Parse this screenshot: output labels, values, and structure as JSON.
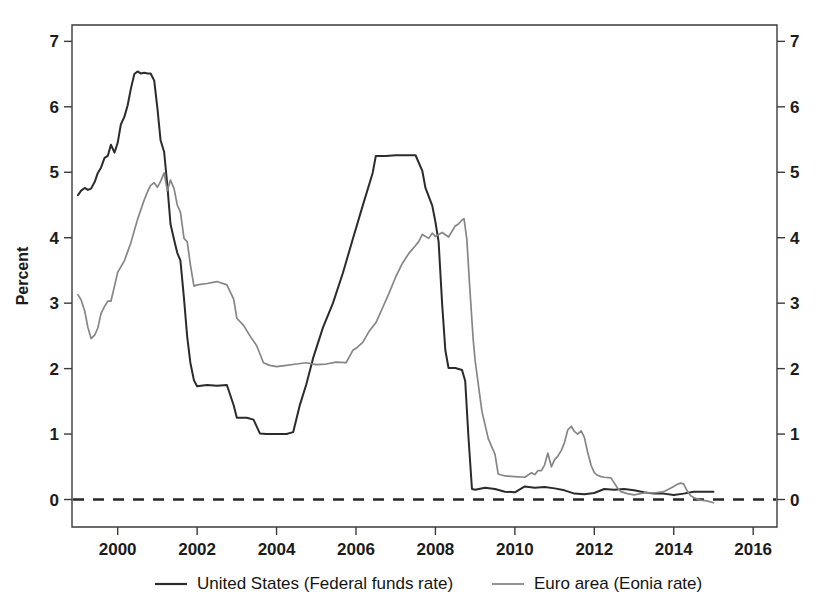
{
  "chart_data": {
    "type": "line",
    "title": "",
    "subtitle": "",
    "xlabel": "",
    "ylabel": "Percent",
    "xlim": [
      1998.85,
      2016.6
    ],
    "ylim": [
      -0.42,
      7.25
    ],
    "grid": false,
    "legend_position": "bottom",
    "x_ticks": [
      2000,
      2002,
      2004,
      2006,
      2008,
      2010,
      2012,
      2014,
      2016
    ],
    "x_tick_labels": [
      "2000",
      "2002",
      "2004",
      "2006",
      "2008",
      "2010",
      "2012",
      "2014",
      "2016"
    ],
    "y_ticks": [
      0,
      1,
      2,
      3,
      4,
      5,
      6,
      7
    ],
    "y_tick_labels": [
      "0",
      "1",
      "2",
      "3",
      "4",
      "5",
      "6",
      "7"
    ],
    "y_ticks_right": [
      0,
      1,
      2,
      3,
      4,
      5,
      6,
      7
    ],
    "y_tick_labels_right": [
      "0",
      "1",
      "2",
      "3",
      "4",
      "5",
      "6",
      "7"
    ],
    "reference_lines": [
      {
        "name": "zero-reference-line",
        "axis": "y",
        "value": 0,
        "style": "dashed"
      }
    ],
    "series": [
      {
        "name": "United States (Federal funds rate)",
        "short_name": "united-states",
        "color": "#2b2b2b",
        "width": 2.0,
        "x": [
          1999.0,
          1999.08,
          1999.17,
          1999.25,
          1999.33,
          1999.42,
          1999.5,
          1999.58,
          1999.67,
          1999.75,
          1999.83,
          1999.92,
          2000.0,
          2000.08,
          2000.17,
          2000.25,
          2000.33,
          2000.42,
          2000.5,
          2000.58,
          2000.67,
          2000.75,
          2000.83,
          2000.92,
          2001.0,
          2001.08,
          2001.17,
          2001.25,
          2001.33,
          2001.42,
          2001.5,
          2001.58,
          2001.67,
          2001.75,
          2001.83,
          2001.92,
          2002.0,
          2002.25,
          2002.5,
          2002.75,
          2002.92,
          2003.0,
          2003.25,
          2003.42,
          2003.58,
          2003.75,
          2004.0,
          2004.25,
          2004.42,
          2004.58,
          2004.75,
          2004.92,
          2005.17,
          2005.42,
          2005.67,
          2005.92,
          2006.17,
          2006.42,
          2006.5,
          2006.75,
          2007.0,
          2007.25,
          2007.5,
          2007.67,
          2007.75,
          2007.92,
          2008.0,
          2008.08,
          2008.17,
          2008.25,
          2008.33,
          2008.5,
          2008.67,
          2008.75,
          2008.83,
          2008.92,
          2009.0,
          2009.25,
          2009.5,
          2009.75,
          2010.0,
          2010.25,
          2010.5,
          2010.75,
          2011.0,
          2011.25,
          2011.5,
          2011.75,
          2012.0,
          2012.25,
          2012.5,
          2012.75,
          2013.0,
          2013.25,
          2013.5,
          2013.75,
          2014.0,
          2014.25,
          2014.5,
          2014.75,
          2015.0
        ],
        "y": [
          4.65,
          4.72,
          4.76,
          4.73,
          4.75,
          4.85,
          4.99,
          5.07,
          5.22,
          5.25,
          5.42,
          5.3,
          5.45,
          5.73,
          5.85,
          6.02,
          6.27,
          6.5,
          6.54,
          6.51,
          6.52,
          6.51,
          6.51,
          6.4,
          5.98,
          5.49,
          5.31,
          4.8,
          4.21,
          3.97,
          3.77,
          3.65,
          3.07,
          2.49,
          2.09,
          1.82,
          1.73,
          1.75,
          1.74,
          1.75,
          1.44,
          1.25,
          1.25,
          1.22,
          1.01,
          1.0,
          1.0,
          1.0,
          1.03,
          1.43,
          1.76,
          2.16,
          2.63,
          3.0,
          3.46,
          3.98,
          4.49,
          4.99,
          5.25,
          5.25,
          5.26,
          5.26,
          5.26,
          5.02,
          4.76,
          4.49,
          4.24,
          3.94,
          2.98,
          2.28,
          2.01,
          2.01,
          1.98,
          1.81,
          0.97,
          0.16,
          0.15,
          0.18,
          0.16,
          0.12,
          0.11,
          0.2,
          0.18,
          0.19,
          0.17,
          0.14,
          0.09,
          0.08,
          0.1,
          0.16,
          0.15,
          0.16,
          0.14,
          0.11,
          0.09,
          0.09,
          0.07,
          0.09,
          0.12,
          0.12,
          0.12
        ]
      },
      {
        "name": "Euro area (Eonia rate)",
        "short_name": "euro-area",
        "color": "#868686",
        "width": 1.7,
        "x": [
          1999.0,
          1999.08,
          1999.17,
          1999.25,
          1999.33,
          1999.42,
          1999.5,
          1999.58,
          1999.67,
          1999.75,
          1999.83,
          1999.92,
          2000.0,
          2000.17,
          2000.33,
          2000.5,
          2000.67,
          2000.75,
          2000.83,
          2000.92,
          2001.0,
          2001.08,
          2001.17,
          2001.25,
          2001.33,
          2001.42,
          2001.5,
          2001.58,
          2001.67,
          2001.75,
          2001.83,
          2001.92,
          2002.0,
          2002.25,
          2002.5,
          2002.75,
          2002.92,
          2003.0,
          2003.17,
          2003.33,
          2003.5,
          2003.67,
          2003.83,
          2004.0,
          2004.25,
          2004.5,
          2004.75,
          2005.0,
          2005.25,
          2005.5,
          2005.75,
          2005.92,
          2006.0,
          2006.17,
          2006.33,
          2006.5,
          2006.67,
          2006.83,
          2007.0,
          2007.17,
          2007.33,
          2007.5,
          2007.58,
          2007.67,
          2007.83,
          2007.92,
          2008.0,
          2008.17,
          2008.33,
          2008.5,
          2008.58,
          2008.67,
          2008.72,
          2008.79,
          2008.87,
          2008.95,
          2009.0,
          2009.17,
          2009.33,
          2009.5,
          2009.58,
          2009.75,
          2010.0,
          2010.25,
          2010.42,
          2010.5,
          2010.58,
          2010.67,
          2010.75,
          2010.83,
          2010.92,
          2011.0,
          2011.08,
          2011.17,
          2011.25,
          2011.33,
          2011.42,
          2011.5,
          2011.58,
          2011.67,
          2011.75,
          2011.83,
          2011.92,
          2012.0,
          2012.08,
          2012.17,
          2012.25,
          2012.42,
          2012.58,
          2012.67,
          2012.83,
          2013.0,
          2013.25,
          2013.5,
          2013.75,
          2014.0,
          2014.08,
          2014.17,
          2014.25,
          2014.33,
          2014.42,
          2014.5,
          2014.58,
          2014.67,
          2014.83,
          2015.0
        ],
        "y": [
          3.13,
          3.05,
          2.88,
          2.63,
          2.46,
          2.51,
          2.62,
          2.84,
          2.95,
          3.03,
          3.03,
          3.26,
          3.47,
          3.65,
          3.92,
          4.28,
          4.58,
          4.7,
          4.8,
          4.84,
          4.77,
          4.86,
          4.99,
          4.72,
          4.88,
          4.75,
          4.5,
          4.39,
          3.99,
          3.94,
          3.59,
          3.26,
          3.28,
          3.3,
          3.33,
          3.28,
          3.06,
          2.77,
          2.66,
          2.5,
          2.35,
          2.09,
          2.05,
          2.03,
          2.05,
          2.07,
          2.09,
          2.06,
          2.07,
          2.1,
          2.09,
          2.28,
          2.31,
          2.4,
          2.57,
          2.7,
          2.93,
          3.15,
          3.4,
          3.61,
          3.76,
          3.88,
          3.94,
          4.05,
          3.99,
          4.07,
          4.02,
          4.08,
          4.01,
          4.18,
          4.21,
          4.27,
          4.29,
          3.98,
          3.19,
          2.45,
          2.12,
          1.35,
          0.93,
          0.69,
          0.39,
          0.36,
          0.35,
          0.34,
          0.41,
          0.38,
          0.44,
          0.44,
          0.53,
          0.71,
          0.5,
          0.61,
          0.66,
          0.75,
          0.87,
          1.06,
          1.12,
          1.04,
          1.0,
          1.05,
          0.95,
          0.73,
          0.52,
          0.41,
          0.37,
          0.35,
          0.34,
          0.33,
          0.18,
          0.12,
          0.09,
          0.07,
          0.1,
          0.1,
          0.12,
          0.2,
          0.23,
          0.25,
          0.24,
          0.14,
          0.06,
          0.03,
          0.01,
          -0.01,
          -0.02,
          -0.05
        ]
      }
    ],
    "legend": [
      {
        "label": "United States (Federal funds rate)",
        "color": "#2b2b2b",
        "marker": "line"
      },
      {
        "label": "Euro area (Eonia rate)",
        "color": "#868686",
        "marker": "line"
      }
    ]
  }
}
